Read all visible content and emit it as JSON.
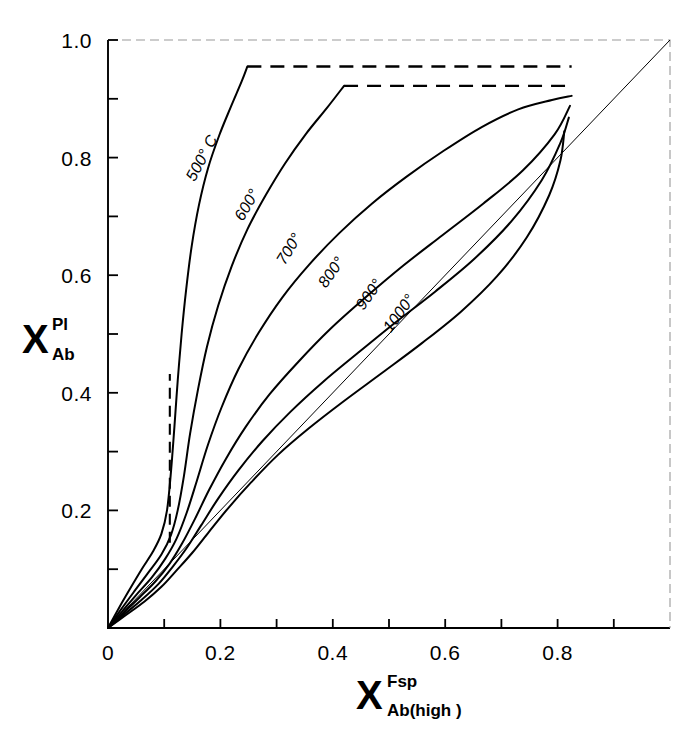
{
  "figure": {
    "background": "#ffffff",
    "ink": "#000000"
  },
  "axis": {
    "x": {
      "base": "X",
      "superscript": "Fsp",
      "subscript": "Ab(high )",
      "tick_labels": [
        "0",
        "0.2",
        "0.4",
        "0.6",
        "0.8"
      ],
      "tick_values": [
        0,
        0.2,
        0.4,
        0.6,
        0.8
      ],
      "minor_tick_values": [
        0.1,
        0.3,
        0.5,
        0.7,
        0.9
      ],
      "range": [
        0,
        1.0
      ]
    },
    "y": {
      "base": "X",
      "superscript": "Pl",
      "subscript": "Ab",
      "tick_labels": [
        "0.2",
        "0.4",
        "0.6",
        "0.8",
        "1.0"
      ],
      "tick_values": [
        0.2,
        0.4,
        0.6,
        0.8,
        1.0
      ],
      "minor_tick_values": [
        0.1,
        0.3,
        0.5,
        0.7,
        0.9
      ],
      "range": [
        0,
        1.0
      ]
    }
  },
  "chart_data": {
    "type": "line",
    "title": "",
    "xlabel": "X Fsp Ab(high)",
    "ylabel": "X Pl Ab",
    "xlim": [
      0,
      1.0
    ],
    "ylim": [
      0,
      1.0
    ],
    "grid": false,
    "legend": "inline-curve-labels",
    "reference_line": {
      "name": "one-to-one-diagonal",
      "from": [
        0,
        0
      ],
      "to": [
        1.0,
        1.0
      ],
      "style": "thin-solid"
    },
    "solvus_dashed_vertical": {
      "name": "solvus-limb",
      "x": 0.11,
      "y_from": 0.145,
      "y_to": 0.432,
      "style": "dashed"
    },
    "series": [
      {
        "name": "500",
        "label": "500° C",
        "label_angle": -62,
        "label_x": 0.175,
        "label_y": 0.795,
        "style": "solid",
        "points": [
          [
            0.0,
            0.0
          ],
          [
            0.02,
            0.035
          ],
          [
            0.04,
            0.068
          ],
          [
            0.06,
            0.1
          ],
          [
            0.08,
            0.13
          ],
          [
            0.095,
            0.16
          ],
          [
            0.105,
            0.2
          ],
          [
            0.112,
            0.265
          ],
          [
            0.118,
            0.34
          ],
          [
            0.124,
            0.42
          ],
          [
            0.131,
            0.5
          ],
          [
            0.139,
            0.575
          ],
          [
            0.149,
            0.65
          ],
          [
            0.162,
            0.72
          ],
          [
            0.178,
            0.782
          ],
          [
            0.198,
            0.838
          ],
          [
            0.218,
            0.885
          ],
          [
            0.238,
            0.93
          ],
          [
            0.248,
            0.955
          ]
        ],
        "plateau": {
          "y": 0.955,
          "x_from": 0.248,
          "x_to": 0.825,
          "style": "dashed"
        }
      },
      {
        "name": "600",
        "label": "600°",
        "label_angle": -60,
        "label_x": 0.255,
        "label_y": 0.715,
        "style": "solid",
        "points": [
          [
            0.0,
            0.0
          ],
          [
            0.022,
            0.03
          ],
          [
            0.045,
            0.06
          ],
          [
            0.07,
            0.092
          ],
          [
            0.095,
            0.125
          ],
          [
            0.112,
            0.158
          ],
          [
            0.124,
            0.2
          ],
          [
            0.135,
            0.258
          ],
          [
            0.146,
            0.33
          ],
          [
            0.16,
            0.405
          ],
          [
            0.176,
            0.478
          ],
          [
            0.196,
            0.548
          ],
          [
            0.22,
            0.615
          ],
          [
            0.248,
            0.678
          ],
          [
            0.28,
            0.735
          ],
          [
            0.315,
            0.79
          ],
          [
            0.352,
            0.84
          ],
          [
            0.39,
            0.885
          ],
          [
            0.42,
            0.922
          ]
        ],
        "plateau": {
          "y": 0.922,
          "x_from": 0.42,
          "x_to": 0.825,
          "style": "dashed"
        }
      },
      {
        "name": "700",
        "label": "700°",
        "label_angle": -58,
        "label_x": 0.33,
        "label_y": 0.64,
        "style": "solid",
        "points": [
          [
            0.0,
            0.0
          ],
          [
            0.025,
            0.028
          ],
          [
            0.05,
            0.056
          ],
          [
            0.078,
            0.086
          ],
          [
            0.102,
            0.118
          ],
          [
            0.122,
            0.152
          ],
          [
            0.14,
            0.196
          ],
          [
            0.158,
            0.25
          ],
          [
            0.178,
            0.312
          ],
          [
            0.202,
            0.375
          ],
          [
            0.232,
            0.44
          ],
          [
            0.268,
            0.502
          ],
          [
            0.31,
            0.562
          ],
          [
            0.358,
            0.618
          ],
          [
            0.412,
            0.672
          ],
          [
            0.47,
            0.722
          ],
          [
            0.532,
            0.768
          ],
          [
            0.598,
            0.812
          ],
          [
            0.665,
            0.852
          ],
          [
            0.73,
            0.882
          ],
          [
            0.79,
            0.898
          ],
          [
            0.825,
            0.905
          ]
        ],
        "plateau": null
      },
      {
        "name": "800",
        "label": "800°",
        "label_angle": -55,
        "label_x": 0.405,
        "label_y": 0.6,
        "style": "solid",
        "points": [
          [
            0.0,
            0.0
          ],
          [
            0.028,
            0.026
          ],
          [
            0.056,
            0.052
          ],
          [
            0.085,
            0.08
          ],
          [
            0.11,
            0.11
          ],
          [
            0.132,
            0.144
          ],
          [
            0.155,
            0.186
          ],
          [
            0.18,
            0.235
          ],
          [
            0.21,
            0.288
          ],
          [
            0.245,
            0.342
          ],
          [
            0.288,
            0.398
          ],
          [
            0.338,
            0.452
          ],
          [
            0.395,
            0.508
          ],
          [
            0.458,
            0.562
          ],
          [
            0.525,
            0.616
          ],
          [
            0.595,
            0.668
          ],
          [
            0.668,
            0.722
          ],
          [
            0.738,
            0.778
          ],
          [
            0.795,
            0.84
          ],
          [
            0.822,
            0.888
          ]
        ],
        "plateau": null
      },
      {
        "name": "900",
        "label": "900°",
        "label_angle": -54,
        "label_x": 0.472,
        "label_y": 0.562,
        "style": "solid",
        "points": [
          [
            0.0,
            0.0
          ],
          [
            0.03,
            0.024
          ],
          [
            0.06,
            0.048
          ],
          [
            0.09,
            0.075
          ],
          [
            0.115,
            0.104
          ],
          [
            0.14,
            0.136
          ],
          [
            0.166,
            0.175
          ],
          [
            0.196,
            0.22
          ],
          [
            0.232,
            0.268
          ],
          [
            0.275,
            0.318
          ],
          [
            0.325,
            0.368
          ],
          [
            0.382,
            0.418
          ],
          [
            0.445,
            0.468
          ],
          [
            0.512,
            0.52
          ],
          [
            0.582,
            0.572
          ],
          [
            0.652,
            0.628
          ],
          [
            0.718,
            0.692
          ],
          [
            0.772,
            0.762
          ],
          [
            0.805,
            0.825
          ],
          [
            0.82,
            0.868
          ]
        ],
        "plateau": null
      },
      {
        "name": "1000",
        "label": "1000°",
        "label_angle": -54,
        "label_x": 0.525,
        "label_y": 0.53,
        "style": "solid",
        "points": [
          [
            0.0,
            0.0
          ],
          [
            0.032,
            0.022
          ],
          [
            0.065,
            0.045
          ],
          [
            0.095,
            0.07
          ],
          [
            0.122,
            0.098
          ],
          [
            0.15,
            0.128
          ],
          [
            0.18,
            0.164
          ],
          [
            0.214,
            0.204
          ],
          [
            0.255,
            0.248
          ],
          [
            0.302,
            0.294
          ],
          [
            0.358,
            0.34
          ],
          [
            0.42,
            0.386
          ],
          [
            0.488,
            0.434
          ],
          [
            0.558,
            0.484
          ],
          [
            0.628,
            0.538
          ],
          [
            0.692,
            0.598
          ],
          [
            0.745,
            0.664
          ],
          [
            0.785,
            0.736
          ],
          [
            0.805,
            0.795
          ],
          [
            0.812,
            0.845
          ]
        ],
        "plateau": null
      }
    ]
  }
}
